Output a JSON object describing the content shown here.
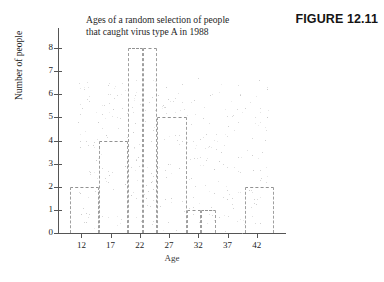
{
  "figure": {
    "label": "FIGURE 12.11"
  },
  "chart_data": {
    "type": "bar",
    "title_lines": [
      "Ages of a random selection of people",
      "that caught virus type A in 1988"
    ],
    "title": "Ages of a random selection of people that caught virus type A in 1988",
    "xlabel": "Age",
    "ylabel": "Number of people",
    "categories": [
      "10-15",
      "15-20",
      "20-25",
      "25-30",
      "30-35",
      "35-40",
      "40-45"
    ],
    "bin_edges": [
      10,
      15,
      20,
      25,
      30,
      35,
      40,
      45
    ],
    "values": [
      2,
      4,
      8,
      5,
      1,
      0,
      2
    ],
    "bar_segments": [
      {
        "start": 10,
        "end": 15,
        "value": 2
      },
      {
        "start": 15,
        "end": 20,
        "value": 4
      },
      {
        "start": 20,
        "end": 22.5,
        "value": 8
      },
      {
        "start": 22.5,
        "end": 25,
        "value": 8
      },
      {
        "start": 25,
        "end": 30,
        "value": 5
      },
      {
        "start": 30,
        "end": 32.5,
        "value": 1
      },
      {
        "start": 32.5,
        "end": 35,
        "value": 1
      },
      {
        "start": 35,
        "end": 40,
        "value": 0
      },
      {
        "start": 40,
        "end": 45,
        "value": 2
      }
    ],
    "xlim": [
      8,
      47
    ],
    "ylim": [
      0,
      8
    ],
    "xticks": [
      12,
      17,
      22,
      27,
      32,
      37,
      42
    ],
    "yticks": [
      0,
      1,
      2,
      3,
      4,
      5,
      6,
      7,
      8
    ],
    "grid": false,
    "legend": false,
    "colors": {
      "bar_outline": "#8d8d8d",
      "axis": "#555555",
      "text": "#1d1d1d",
      "background": "#ffffff"
    }
  }
}
